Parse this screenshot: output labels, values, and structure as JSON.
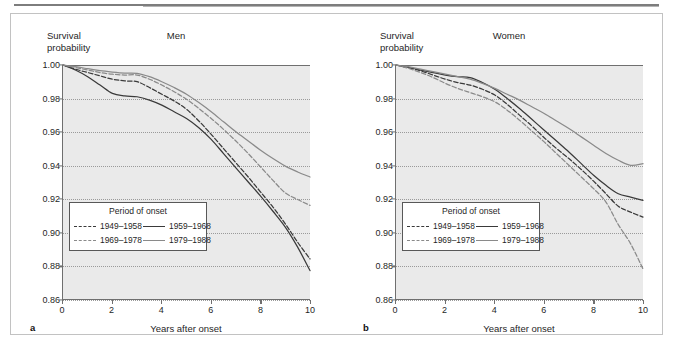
{
  "figure": {
    "panels": [
      {
        "letter": "a",
        "title": "Men",
        "ylabel": "Survival\nprobability",
        "xlabel": "Years after onset"
      },
      {
        "letter": "b",
        "title": "Women",
        "ylabel": "Survival\nprobability",
        "xlabel": "Years after onset"
      }
    ],
    "legend": {
      "title": "Period of onset",
      "entries": [
        {
          "label": "1949–1958",
          "style": "dashed",
          "color": "#3a3a3a"
        },
        {
          "label": "1959–1968",
          "style": "solid",
          "color": "#3a3a3a"
        },
        {
          "label": "1969–1978",
          "style": "dashed",
          "color": "#8a8a8a"
        },
        {
          "label": "1979–1988",
          "style": "solid",
          "color": "#8a8a8a"
        }
      ]
    },
    "colors": {
      "plot_background": "#eaeaea",
      "axis": "#6f6f6f",
      "grid": "#9a9a9a",
      "series_dark": "#3a3a3a",
      "series_gray": "#8a8a8a",
      "frame": "#c2c2c2"
    }
  },
  "chart_data": [
    {
      "type": "line",
      "title": "Men",
      "panel": "a",
      "xlabel": "Years after onset",
      "ylabel": "Survival probability",
      "xlim": [
        0,
        10
      ],
      "ylim": [
        0.86,
        1.0
      ],
      "xticks": [
        0,
        2,
        4,
        6,
        8,
        10
      ],
      "yticks": [
        0.86,
        0.88,
        0.9,
        0.92,
        0.94,
        0.96,
        0.98,
        1.0
      ],
      "grid": true,
      "legend_position": "lower-left-inside",
      "x": [
        0,
        0.5,
        1,
        1.5,
        2,
        2.5,
        3,
        3.5,
        4,
        4.5,
        5,
        5.5,
        6,
        6.5,
        7,
        7.5,
        8,
        8.5,
        9,
        9.5,
        10
      ],
      "series": [
        {
          "name": "1949–1958",
          "style": "dashed",
          "color": "#3a3a3a",
          "values": [
            1.0,
            0.9975,
            0.9955,
            0.9935,
            0.9915,
            0.9905,
            0.99,
            0.9865,
            0.9825,
            0.9785,
            0.9735,
            0.9665,
            0.9585,
            0.95,
            0.9415,
            0.933,
            0.924,
            0.915,
            0.905,
            0.894,
            0.884
          ]
        },
        {
          "name": "1959–1968",
          "style": "solid",
          "color": "#3a3a3a",
          "values": [
            1.0,
            0.997,
            0.993,
            0.988,
            0.983,
            0.9815,
            0.981,
            0.979,
            0.976,
            0.972,
            0.968,
            0.9625,
            0.9555,
            0.947,
            0.9385,
            0.93,
            0.9215,
            0.9125,
            0.903,
            0.891,
            0.877
          ]
        },
        {
          "name": "1969–1978",
          "style": "dashed",
          "color": "#8a8a8a",
          "values": [
            1.0,
            0.9985,
            0.997,
            0.9955,
            0.9945,
            0.994,
            0.994,
            0.9915,
            0.988,
            0.984,
            0.9795,
            0.974,
            0.968,
            0.9615,
            0.9545,
            0.947,
            0.939,
            0.931,
            0.9235,
            0.9195,
            0.916
          ]
        },
        {
          "name": "1979–1988",
          "style": "solid",
          "color": "#8a8a8a",
          "values": [
            1.0,
            0.999,
            0.9978,
            0.9966,
            0.9958,
            0.9952,
            0.995,
            0.993,
            0.99,
            0.9865,
            0.9825,
            0.9775,
            0.972,
            0.966,
            0.96,
            0.9545,
            0.949,
            0.944,
            0.9395,
            0.936,
            0.933
          ]
        }
      ]
    },
    {
      "type": "line",
      "title": "Women",
      "panel": "b",
      "xlabel": "Years after onset",
      "ylabel": "Survival probability",
      "xlim": [
        0,
        10
      ],
      "ylim": [
        0.86,
        1.0
      ],
      "xticks": [
        0,
        2,
        4,
        6,
        8,
        10
      ],
      "yticks": [
        0.86,
        0.88,
        0.9,
        0.92,
        0.94,
        0.96,
        0.98,
        1.0
      ],
      "grid": true,
      "legend_position": "lower-left-inside",
      "x": [
        0,
        0.5,
        1,
        1.5,
        2,
        2.5,
        3,
        3.5,
        4,
        4.5,
        5,
        5.5,
        6,
        6.5,
        7,
        7.5,
        8,
        8.5,
        9,
        9.5,
        10
      ],
      "series": [
        {
          "name": "1949–1958",
          "style": "dashed",
          "color": "#3a3a3a",
          "values": [
            1.0,
            0.9985,
            0.9965,
            0.994,
            0.9915,
            0.9895,
            0.988,
            0.9855,
            0.982,
            0.9765,
            0.97,
            0.9635,
            0.9565,
            0.95,
            0.944,
            0.9375,
            0.9305,
            0.923,
            0.9155,
            0.912,
            0.909
          ]
        },
        {
          "name": "1959–1968",
          "style": "solid",
          "color": "#3a3a3a",
          "values": [
            1.0,
            0.9985,
            0.997,
            0.9955,
            0.994,
            0.993,
            0.9925,
            0.9895,
            0.9855,
            0.98,
            0.974,
            0.9675,
            0.961,
            0.9545,
            0.948,
            0.941,
            0.934,
            0.928,
            0.923,
            0.921,
            0.919
          ]
        },
        {
          "name": "1969–1978",
          "style": "dashed",
          "color": "#8a8a8a",
          "values": [
            1.0,
            0.998,
            0.9955,
            0.9925,
            0.989,
            0.986,
            0.9835,
            0.981,
            0.978,
            0.973,
            0.967,
            0.9605,
            0.954,
            0.947,
            0.94,
            0.933,
            0.926,
            0.918,
            0.9045,
            0.893,
            0.878
          ]
        },
        {
          "name": "1979–1988",
          "style": "solid",
          "color": "#8a8a8a",
          "values": [
            1.0,
            0.999,
            0.9975,
            0.996,
            0.9945,
            0.993,
            0.9915,
            0.989,
            0.986,
            0.9825,
            0.979,
            0.975,
            0.971,
            0.9665,
            0.962,
            0.957,
            0.952,
            0.947,
            0.943,
            0.94,
            0.941
          ]
        }
      ]
    }
  ]
}
